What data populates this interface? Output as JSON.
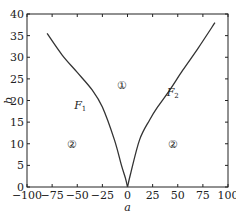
{
  "chart_data": {
    "type": "line",
    "title": "",
    "xlabel": "a",
    "ylabel": "b",
    "xlim": [
      -100,
      100
    ],
    "ylim": [
      0,
      40
    ],
    "xticks": [
      -100,
      -75,
      -50,
      -25,
      0,
      25,
      50,
      75,
      100
    ],
    "yticks": [
      0,
      5,
      10,
      15,
      20,
      25,
      30,
      35,
      40
    ],
    "xtick_labels": [
      "−100",
      "−75",
      "−50",
      "−25",
      "0",
      "25",
      "50",
      "75",
      "100"
    ],
    "ytick_labels": [
      "0",
      "5",
      "10",
      "15",
      "20",
      "25",
      "30",
      "35",
      "40"
    ],
    "grid": false,
    "legend": null,
    "series": [
      {
        "name": "F1",
        "color": "#333333",
        "points": [
          [
            -80,
            35.5
          ],
          [
            -65,
            30.5
          ],
          [
            -50,
            26.5
          ],
          [
            -35,
            22.4
          ],
          [
            -25,
            18.5
          ],
          [
            -13,
            10.9
          ],
          [
            -6,
            5
          ],
          [
            -2,
            2
          ],
          [
            0,
            0
          ]
        ]
      },
      {
        "name": "F2",
        "color": "#333333",
        "points": [
          [
            0,
            0
          ],
          [
            3,
            3
          ],
          [
            12,
            10.9
          ],
          [
            22,
            15.5
          ],
          [
            30,
            18.5
          ],
          [
            42,
            22.4
          ],
          [
            55,
            27
          ],
          [
            70,
            32
          ],
          [
            87,
            38
          ]
        ]
      }
    ],
    "annotations": [
      {
        "text": "F",
        "sub": "1",
        "a": -47,
        "b": 19,
        "italic": true
      },
      {
        "text": "F",
        "sub": "2",
        "a": 45,
        "b": 22,
        "italic": true
      },
      {
        "text": "①",
        "a": -5,
        "b": 23.5
      },
      {
        "text": "②",
        "a": -55,
        "b": 10
      },
      {
        "text": "②",
        "a": 45,
        "b": 10
      }
    ]
  }
}
